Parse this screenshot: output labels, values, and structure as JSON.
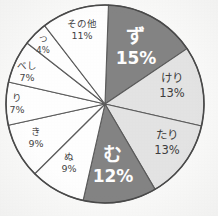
{
  "chart_data": {
    "type": "pie",
    "title": "",
    "xlabel": "",
    "ylabel": "",
    "start_angle_deg": -90,
    "direction": "clockwise",
    "rotation_deg": 2,
    "center": [
      105,
      104
    ],
    "radius": 99,
    "legend": "none",
    "labels_inside": true,
    "categories": [
      "ず",
      "けり",
      "たり",
      "む",
      "ぬ",
      "き",
      "り",
      "べし",
      "つ",
      "その他"
    ],
    "values": [
      15,
      13,
      13,
      12,
      9,
      9,
      7,
      7,
      4,
      11
    ],
    "value_suffix": "%",
    "slices": [
      {
        "name": "ず",
        "percent": "15%",
        "value": 15,
        "fill": "#848484",
        "text_color": "#ffffff",
        "emphasis": "big",
        "label_x": 136,
        "label_y": 47
      },
      {
        "name": "けり",
        "percent": "13%",
        "value": 13,
        "fill": "#e4e4e4",
        "text_color": "#3d3d3d",
        "emphasis": "mid",
        "label_x": 172,
        "label_y": 86
      },
      {
        "name": "たり",
        "percent": "13%",
        "value": 13,
        "fill": "#e4e4e4",
        "text_color": "#3d3d3d",
        "emphasis": "mid",
        "label_x": 167,
        "label_y": 143
      },
      {
        "name": "む",
        "percent": "12%",
        "value": 12,
        "fill": "#848484",
        "text_color": "#ffffff",
        "emphasis": "big",
        "label_x": 113,
        "label_y": 165
      },
      {
        "name": "ぬ",
        "percent": "9%",
        "value": 9,
        "fill": "#ffffff",
        "text_color": "#454545",
        "emphasis": "sm",
        "label_x": 69,
        "label_y": 163
      },
      {
        "name": "き",
        "percent": "9%",
        "value": 9,
        "fill": "#ffffff",
        "text_color": "#454545",
        "emphasis": "sm",
        "label_x": 36,
        "label_y": 138
      },
      {
        "name": "り",
        "percent": "7%",
        "value": 7,
        "fill": "#ffffff",
        "text_color": "#454545",
        "emphasis": "sm",
        "label_x": 17,
        "label_y": 104
      },
      {
        "name": "べし",
        "percent": "7%",
        "value": 7,
        "fill": "#ffffff",
        "text_color": "#454545",
        "emphasis": "sm",
        "label_x": 27,
        "label_y": 72
      },
      {
        "name": "つ",
        "percent": "4%",
        "value": 4,
        "fill": "#ffffff",
        "text_color": "#484848",
        "emphasis": "xs",
        "label_x": 43,
        "label_y": 45
      },
      {
        "name": "その他",
        "percent": "11%",
        "value": 11,
        "fill": "#ffffff",
        "text_color": "#454545",
        "emphasis": "sm",
        "label_x": 82,
        "label_y": 30
      }
    ],
    "colors": {
      "emphasis_dark": "#848484",
      "secondary_light": "#e4e4e4",
      "plain": "#ffffff",
      "outline": "#4a4a4a",
      "background": "#fbfbfa"
    }
  }
}
